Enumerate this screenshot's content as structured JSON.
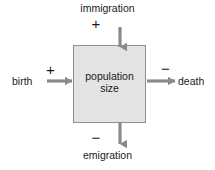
{
  "diagram": {
    "central_node": {
      "name": "population-size-box",
      "line1": "population",
      "line2": "size",
      "fill_color": "#e3e3e3",
      "border_color": "#8f8f8f"
    },
    "flows": [
      {
        "id": "immigration",
        "label": "immigration",
        "sign": "+",
        "direction": "in",
        "side": "top",
        "arrow_color": "#8a8a8a"
      },
      {
        "id": "birth",
        "label": "birth",
        "sign": "+",
        "direction": "in",
        "side": "left",
        "arrow_color": "#8a8a8a"
      },
      {
        "id": "death",
        "label": "death",
        "sign": "−",
        "direction": "out",
        "side": "right",
        "arrow_color": "#8a8a8a"
      },
      {
        "id": "emigration",
        "label": "emigration",
        "sign": "−",
        "direction": "out",
        "side": "bottom",
        "arrow_color": "#8a8a8a"
      }
    ],
    "background_color": "#ffffff",
    "text_color": "#1a1a1a"
  }
}
